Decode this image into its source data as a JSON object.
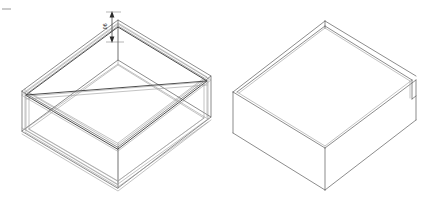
{
  "drawing": {
    "title": "Isometric box views",
    "background_color": "#ffffff",
    "line_color": "#5a5a5a",
    "heavy_line_color": "#2b2b2b",
    "light_line_color": "#9a9a9a",
    "projection": "isometric",
    "views": [
      {
        "id": "wireframe-view",
        "name": "Wireframe isometric box",
        "style": "wireframe-all-edges-visible",
        "description": "Open-top rectangular tray shown with all edges including hidden internal edges"
      },
      {
        "id": "solid-view",
        "name": "Hidden-line-removed isometric box",
        "style": "hidden-line-removed",
        "description": "Open-top rectangular tray shown as opaque solid with visible wall thickness"
      }
    ]
  },
  "annotations": {
    "dimension": {
      "id": "rim-thickness-dimension",
      "label": ".06",
      "orientation": "vertical",
      "text_rotation_deg": -90,
      "arrow_style": "double-ended",
      "measures": "top rim wall thickness"
    },
    "corner_mark": {
      "id": "sheet-corner-tick",
      "label": "",
      "description": "Small horizontal registration tick at top-left of sheet"
    }
  }
}
